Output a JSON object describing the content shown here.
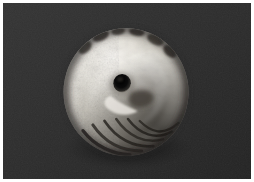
{
  "image": {
    "kind": "photograph",
    "subject": "seashell",
    "subject_detail": "spiral sea snail shell viewed from the apex, showing concentric whorls and a dark central aperture",
    "orientation": "landscape",
    "width_px": 254,
    "height_px": 182,
    "alt_text": "Close-up photograph of a pale grey-white spiral seashell centred on a dark charcoal background, with a white border.",
    "border": {
      "present": true,
      "color": "#ffffff",
      "width_px": 3
    },
    "background": {
      "description": "flat dark charcoal studio backdrop with faint grain",
      "color": "#2b2b2b",
      "color_secondary": "#333333",
      "color_shadow": "#1e1e1e"
    },
    "subject_geometry": {
      "center_x_px": 126,
      "center_y_px": 92,
      "radius_x_px": 64,
      "radius_y_px": 66,
      "bounds": {
        "left_px": 62,
        "top_px": 26,
        "right_px": 190,
        "bottom_px": 158
      }
    },
    "aperture": {
      "label": "central aperture",
      "center_x_px": 122,
      "center_y_px": 83,
      "radius_px": 9,
      "color": "#0d0d0d"
    },
    "palette": {
      "highlight": "#f2efe9",
      "light": "#dedbd3",
      "midtone": "#aaa69d",
      "shade": "#6f6b63",
      "deep_shade": "#3d3a35",
      "dark_mottle": "#2a2724"
    },
    "lighting": {
      "key_light_direction": "upper-left",
      "shadow_side": "lower-right"
    },
    "features": [
      {
        "name": "outer-whorl",
        "note": "broad pale band sweeping clockwise around the rim"
      },
      {
        "name": "inner-whorl",
        "note": "tighter bright spiral converging toward the apex"
      },
      {
        "name": "dark-mottling-top",
        "note": "irregular dark blotches along the upper rim"
      },
      {
        "name": "ribbed-base",
        "note": "dark ridged striations across the lower edge"
      },
      {
        "name": "granular-left-edge",
        "note": "rough pitted texture on the left flank"
      }
    ]
  }
}
